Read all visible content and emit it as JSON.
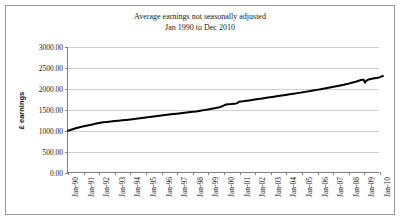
{
  "figure": {
    "background_color": "#ffffff",
    "border_color": "#9a9a9a",
    "line_color": "#000000",
    "gridline_color": "#cfcfcf",
    "axis_color": "#808080"
  },
  "chart_data": {
    "type": "line",
    "title": "Average earnings not seasonally adjusted",
    "subtitle": "Jan 1990 to Dec 2010",
    "title_lines": [
      "Average earnings not seasonally adjusted",
      "Jan 1990 to Dec 2010"
    ],
    "xlabel": "",
    "ylabel": "£ earnings",
    "ylim": [
      0,
      3000
    ],
    "ytick_values": [
      0,
      500,
      1000,
      1500,
      2000,
      2500,
      3000
    ],
    "ytick_labels": [
      "0.00",
      "500.00",
      "1000.00",
      "1500.00",
      "2000.00",
      "2500.00",
      "3000.00"
    ],
    "grid": true,
    "grid_axis": "y",
    "legend": false,
    "legend_position": "none",
    "categories": [
      "Jan-90",
      "Jan-91",
      "Jan-92",
      "Jan-93",
      "Jan-94",
      "Jan-95",
      "Jan-96",
      "Jan-97",
      "Jan-98",
      "Jan-99",
      "Jan-00",
      "Jan-01",
      "Jan-02",
      "Jan-03",
      "Jan-04",
      "Jan-05",
      "Jan-06",
      "Jan-07",
      "Jan-08",
      "Jan-09",
      "Jan-10"
    ],
    "xtick_labels": [
      "Jan-90",
      "Jan-91",
      "Jan-92",
      "Jan-93",
      "Jan-94",
      "Jan-95",
      "Jan-96",
      "Jan-97",
      "Jan-98",
      "Jan-99",
      "Jan-00",
      "Jan-01",
      "Jan-02",
      "Jan-03",
      "Jan-04",
      "Jan-05",
      "Jan-06",
      "Jan-07",
      "Jan-08",
      "Jan-09",
      "Jan-10"
    ],
    "series": [
      {
        "name": "Average earnings",
        "color": "#000000",
        "line_width": 2,
        "points": [
          {
            "x": 0.0,
            "y": 1000
          },
          {
            "x": 0.25,
            "y": 1030
          },
          {
            "x": 0.5,
            "y": 1060
          },
          {
            "x": 0.75,
            "y": 1085
          },
          {
            "x": 1.0,
            "y": 1105
          },
          {
            "x": 1.25,
            "y": 1125
          },
          {
            "x": 1.5,
            "y": 1145
          },
          {
            "x": 1.75,
            "y": 1165
          },
          {
            "x": 2.0,
            "y": 1185
          },
          {
            "x": 2.25,
            "y": 1200
          },
          {
            "x": 2.5,
            "y": 1210
          },
          {
            "x": 2.75,
            "y": 1220
          },
          {
            "x": 3.0,
            "y": 1230
          },
          {
            "x": 3.25,
            "y": 1238
          },
          {
            "x": 3.5,
            "y": 1248
          },
          {
            "x": 3.75,
            "y": 1258
          },
          {
            "x": 4.0,
            "y": 1268
          },
          {
            "x": 4.25,
            "y": 1280
          },
          {
            "x": 4.5,
            "y": 1292
          },
          {
            "x": 4.75,
            "y": 1304
          },
          {
            "x": 5.0,
            "y": 1316
          },
          {
            "x": 5.25,
            "y": 1328
          },
          {
            "x": 5.5,
            "y": 1340
          },
          {
            "x": 5.75,
            "y": 1352
          },
          {
            "x": 6.0,
            "y": 1364
          },
          {
            "x": 6.25,
            "y": 1376
          },
          {
            "x": 6.5,
            "y": 1388
          },
          {
            "x": 6.75,
            "y": 1398
          },
          {
            "x": 7.0,
            "y": 1408
          },
          {
            "x": 7.25,
            "y": 1418
          },
          {
            "x": 7.5,
            "y": 1430
          },
          {
            "x": 7.75,
            "y": 1442
          },
          {
            "x": 8.0,
            "y": 1452
          },
          {
            "x": 8.25,
            "y": 1462
          },
          {
            "x": 8.5,
            "y": 1476
          },
          {
            "x": 8.75,
            "y": 1492
          },
          {
            "x": 9.0,
            "y": 1508
          },
          {
            "x": 9.25,
            "y": 1524
          },
          {
            "x": 9.5,
            "y": 1542
          },
          {
            "x": 9.75,
            "y": 1562
          },
          {
            "x": 10.0,
            "y": 1600
          },
          {
            "x": 10.15,
            "y": 1625
          },
          {
            "x": 10.3,
            "y": 1632
          },
          {
            "x": 10.5,
            "y": 1636
          },
          {
            "x": 10.7,
            "y": 1642
          },
          {
            "x": 10.9,
            "y": 1660
          },
          {
            "x": 11.0,
            "y": 1690
          },
          {
            "x": 11.25,
            "y": 1702
          },
          {
            "x": 11.5,
            "y": 1716
          },
          {
            "x": 11.75,
            "y": 1730
          },
          {
            "x": 12.0,
            "y": 1744
          },
          {
            "x": 12.25,
            "y": 1758
          },
          {
            "x": 12.5,
            "y": 1772
          },
          {
            "x": 12.75,
            "y": 1786
          },
          {
            "x": 13.0,
            "y": 1800
          },
          {
            "x": 13.25,
            "y": 1814
          },
          {
            "x": 13.5,
            "y": 1828
          },
          {
            "x": 13.75,
            "y": 1842
          },
          {
            "x": 14.0,
            "y": 1856
          },
          {
            "x": 14.25,
            "y": 1870
          },
          {
            "x": 14.5,
            "y": 1884
          },
          {
            "x": 14.75,
            "y": 1898
          },
          {
            "x": 15.0,
            "y": 1912
          },
          {
            "x": 15.25,
            "y": 1928
          },
          {
            "x": 15.5,
            "y": 1944
          },
          {
            "x": 15.75,
            "y": 1960
          },
          {
            "x": 16.0,
            "y": 1976
          },
          {
            "x": 16.25,
            "y": 1992
          },
          {
            "x": 16.5,
            "y": 2008
          },
          {
            "x": 16.75,
            "y": 2026
          },
          {
            "x": 17.0,
            "y": 2044
          },
          {
            "x": 17.25,
            "y": 2062
          },
          {
            "x": 17.5,
            "y": 2080
          },
          {
            "x": 17.75,
            "y": 2100
          },
          {
            "x": 18.0,
            "y": 2120
          },
          {
            "x": 18.25,
            "y": 2145
          },
          {
            "x": 18.5,
            "y": 2170
          },
          {
            "x": 18.7,
            "y": 2195
          },
          {
            "x": 18.85,
            "y": 2210
          },
          {
            "x": 18.95,
            "y": 2218
          },
          {
            "x": 19.02,
            "y": 2216
          },
          {
            "x": 19.1,
            "y": 2150
          },
          {
            "x": 19.18,
            "y": 2190
          },
          {
            "x": 19.28,
            "y": 2215
          },
          {
            "x": 19.4,
            "y": 2228
          },
          {
            "x": 19.55,
            "y": 2240
          },
          {
            "x": 19.7,
            "y": 2252
          },
          {
            "x": 19.85,
            "y": 2262
          },
          {
            "x": 20.0,
            "y": 2272
          },
          {
            "x": 20.1,
            "y": 2285
          },
          {
            "x": 20.18,
            "y": 2300
          },
          {
            "x": 20.25,
            "y": 2305
          }
        ]
      }
    ]
  }
}
